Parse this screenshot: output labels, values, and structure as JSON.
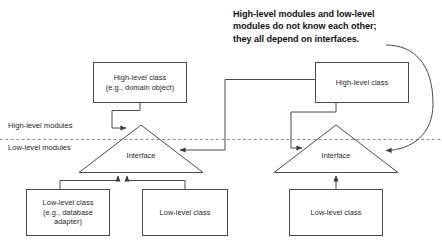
{
  "diagram": {
    "background_color": "#ffffff",
    "line_color": "#4a4a4a",
    "text_color": "#262626",
    "callout_color": "#111111",
    "divider": {
      "style": "dashed",
      "above_label": "High-level modules",
      "below_label": "Low-level modules"
    },
    "callout": {
      "text": "High-level modules and low-level\nmodules do not know each other;\nthey all depend on interfaces."
    },
    "left_group": {
      "high_level": {
        "line1": "High-level class",
        "line2": "(e.g., domain object)"
      },
      "interface_label": "Interface",
      "low_level_a": {
        "line1": "Low-level class",
        "line2": "(e.g., database",
        "line3": "adapter)"
      },
      "low_level_b": {
        "line1": "Low-level class"
      }
    },
    "right_group": {
      "high_level": {
        "line1": "High-level class"
      },
      "interface_label": "Interface",
      "low_level": {
        "line1": "Low-level class"
      }
    },
    "connectors": [
      {
        "name": "left-high-to-left-interface",
        "kind": "elbow-arrow"
      },
      {
        "name": "right-high-to-left-interface",
        "kind": "elbow-arrow"
      },
      {
        "name": "right-high-to-right-interface",
        "kind": "elbow-arrow"
      },
      {
        "name": "left-lowlevels-to-left-interface",
        "kind": "bracket-arrow"
      },
      {
        "name": "right-lowlevel-to-right-interface",
        "kind": "straight-arrow"
      },
      {
        "name": "callout-pointer",
        "kind": "curved-arrow"
      }
    ]
  }
}
